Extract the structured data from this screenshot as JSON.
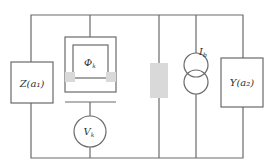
{
  "diagram": {
    "type": "circuit",
    "components": {
      "left_impedance": {
        "label": "Z(a₁)"
      },
      "junction": {
        "label": "Φk",
        "main": "Φ",
        "sub": "k"
      },
      "voltmeter": {
        "label": "Vk",
        "main": "V",
        "sub": "k"
      },
      "resistor": {
        "label": ""
      },
      "current_source": {
        "label": "Ib",
        "main": "I",
        "sub": "b"
      },
      "right_admittance": {
        "label": "Y(a₂)"
      }
    },
    "colors": {
      "wire": "#6a6a6a",
      "shaded": "#d9d9d9",
      "text": "#333333"
    }
  }
}
